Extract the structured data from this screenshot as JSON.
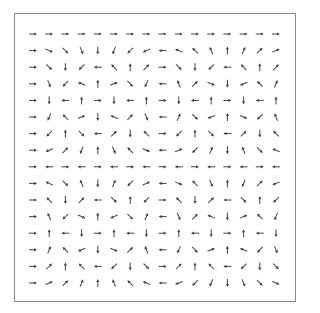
{
  "chart_data": {
    "type": "quiver",
    "title": "",
    "xlabel": "",
    "ylabel": "",
    "grid": false,
    "legend": null,
    "rows": 16,
    "cols": 16,
    "angle_step_deg": 22.5,
    "angle_rule": "angle(row, col) = (row * col * 22.5) mod 360, measured clockwise on screen from pointing right",
    "row_step_degrees": [
      0,
      22.5,
      45,
      67.5,
      90,
      112.5,
      135,
      157.5,
      180,
      202.5,
      225,
      247.5,
      270,
      292.5,
      315,
      337.5
    ],
    "arrow_length_px": 8,
    "arrow_color": "#444444",
    "frame_color": "#8a8a8a"
  },
  "layout": {
    "frame": {
      "x": 14,
      "y": 13,
      "width": 281,
      "height": 288
    },
    "grid_origin": {
      "x": 33,
      "y": 34
    },
    "grid_spacing": {
      "x": 16.2,
      "y": 16.6
    }
  }
}
